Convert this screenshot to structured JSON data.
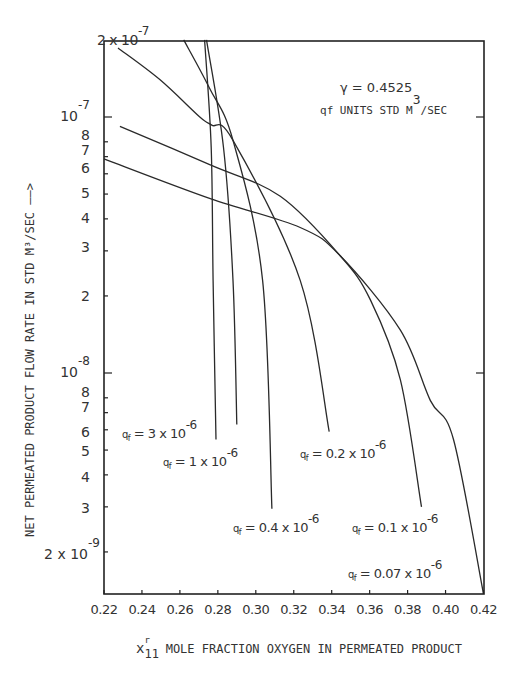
{
  "chart_data": {
    "type": "line",
    "title": "",
    "xlabel": "x11^r MOLE FRACTION OXYGEN IN PERMEATED PRODUCT",
    "ylabel": "NET PERMEATED PRODUCT FLOW RATE IN STD M^3/SEC",
    "xscale": "linear",
    "yscale": "log",
    "xlim": [
      0.22,
      0.42
    ],
    "ylim": [
      1.37e-09,
      2e-07
    ],
    "grid": false,
    "legend": "inline labels",
    "x_ticks": [
      "0.22",
      "0.24",
      "0.26",
      "0.28",
      "0.30",
      "0.32",
      "0.34",
      "0.36",
      "0.38",
      "0.40",
      "0.42"
    ],
    "y_tick_labels": [
      {
        "value": 2e-07,
        "label": "2 x 10",
        "exp": "-7"
      },
      {
        "value": 1e-07,
        "label": "10",
        "exp": "-7"
      },
      {
        "value": 8e-08,
        "label": "8"
      },
      {
        "value": 7e-08,
        "label": "7"
      },
      {
        "value": 6e-08,
        "label": "6"
      },
      {
        "value": 5e-08,
        "label": "5"
      },
      {
        "value": 4e-08,
        "label": "4"
      },
      {
        "value": 3e-08,
        "label": "3"
      },
      {
        "value": 2e-08,
        "label": "2"
      },
      {
        "value": 1e-08,
        "label": "10",
        "exp": "-8"
      },
      {
        "value": 8e-09,
        "label": "8"
      },
      {
        "value": 7e-09,
        "label": "7"
      },
      {
        "value": 6e-09,
        "label": "6"
      },
      {
        "value": 5e-09,
        "label": "5"
      },
      {
        "value": 4e-09,
        "label": "4"
      },
      {
        "value": 3e-09,
        "label": "3"
      },
      {
        "value": 2e-09,
        "label": "2 x 10",
        "exp": "-9"
      }
    ],
    "annotations": [
      {
        "text": "γ = 0.4525"
      },
      {
        "text": "qf UNITS STD M^3/SEC"
      }
    ],
    "series": [
      {
        "name": "q_f = 3 x 10^-6",
        "x": [
          0.273,
          0.2765,
          0.2775,
          0.279
        ],
        "y": [
          2e-07,
          7.6e-08,
          2.3e-08,
          5.5e-09
        ]
      },
      {
        "name": "q_f = 1 x 10^-6",
        "x": [
          0.274,
          0.283,
          0.288,
          0.29
        ],
        "y": [
          2e-07,
          7.6e-08,
          2.3e-08,
          6.3e-09
        ]
      },
      {
        "name": "q_f = 0.4 x 10^-6",
        "x": [
          0.262,
          0.2755,
          0.288,
          0.3036,
          0.3085
        ],
        "y": [
          2e-07,
          1.3e-07,
          8.1e-08,
          2.3e-08,
          2.95e-09
        ]
      },
      {
        "name": "q_f = 0.2 x 10^-6",
        "x": [
          0.2274,
          0.2494,
          0.2705,
          0.2768,
          0.288,
          0.3234,
          0.3387
        ],
        "y": [
          1.86e-07,
          1.4e-07,
          1e-07,
          9.3e-08,
          8.1e-08,
          2.3e-08,
          5.9e-09
        ]
      },
      {
        "name": "q_f = 0.1 x 10^-6",
        "x": [
          0.2284,
          0.276,
          0.3129,
          0.3445,
          0.3604,
          0.3762,
          0.3873
        ],
        "y": [
          9.2e-08,
          6.5e-08,
          4.9e-08,
          2.87e-08,
          1.93e-08,
          9.4e-09,
          3e-09
        ]
      },
      {
        "name": "q_f = 0.07 x 10^-6",
        "x": [
          0.22,
          0.276,
          0.3234,
          0.3445,
          0.3762,
          0.392,
          0.4042,
          0.42
        ],
        "y": [
          6.86e-08,
          4.8e-08,
          3.7e-08,
          2.87e-08,
          1.47e-08,
          7.8e-09,
          5.5e-09,
          1.37e-09
        ]
      }
    ]
  },
  "labels": {
    "top_tick": {
      "base": "2 x 10",
      "exp": "-7"
    },
    "gamma": "γ  = 0.4525",
    "units_q": "q",
    "units_sub": "f",
    "units_text": " UNITS STD M",
    "units_exp": "3",
    "units_tail": "/SEC",
    "ylabel": "NET PERMEATED PRODUCT FLOW RATE IN STD M³/SEC ——>",
    "xlabel_var": "x",
    "xlabel_sub": "11",
    "xlabel_sup": "r",
    "xlabel_text": " MOLE FRACTION OXYGEN IN PERMEATED PRODUCT",
    "curve_labels": [
      {
        "q": "q",
        "sub": "f",
        "text": " = 3 x 10",
        "exp": "-6"
      },
      {
        "q": "q",
        "sub": "f",
        "text": "  = 1 x 10",
        "exp": "-6"
      },
      {
        "q": "q",
        "sub": "f",
        "text": "  = 0.4 x 10",
        "exp": "-6"
      },
      {
        "q": "q",
        "sub": "f",
        "text": " = 0.2 x 10",
        "exp": "-6"
      },
      {
        "q": "q",
        "sub": "f",
        "text": "  = 0.1 x 10",
        "exp": "-6"
      },
      {
        "q": "q",
        "sub": "f",
        "text": "  = 0.07 x 10",
        "exp": "-6"
      }
    ]
  },
  "colors": {
    "line": "#2a2a2a",
    "axis": "#222222",
    "text": "#333333"
  }
}
